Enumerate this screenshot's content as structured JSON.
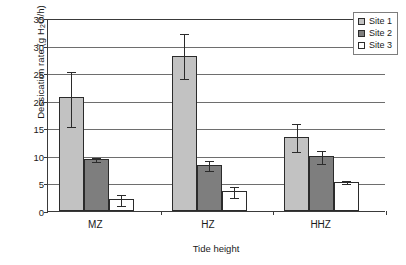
{
  "chart_data": {
    "type": "bar",
    "title": "",
    "xlabel": "Tide height",
    "ylabel": "Dessication rate (g H",
    "ylabel_sub": "2",
    "ylabel_tail": "O/h)",
    "ylabel_full": "Dessication rate (g H2O/h)",
    "categories": [
      "MZ",
      "HZ",
      "HHZ"
    ],
    "ylim": [
      0,
      35
    ],
    "yticks": [
      0,
      5,
      10,
      15,
      20,
      25,
      30,
      35
    ],
    "ytick_labels": [
      "0",
      "5",
      "10",
      "15",
      "20",
      "25",
      "30",
      "35"
    ],
    "grid": true,
    "legend_position": "top-right",
    "series": [
      {
        "name": "Site 1",
        "color": "#c2c2c2",
        "values": [
          20.7,
          28.2,
          13.4
        ],
        "err_low": [
          15.4,
          24.2,
          10.8
        ],
        "err_high": [
          25.4,
          32.2,
          15.9
        ]
      },
      {
        "name": "Site 2",
        "color": "#7e7e7e",
        "values": [
          9.5,
          8.3,
          9.9
        ],
        "err_low": [
          9.1,
          7.5,
          8.7
        ],
        "err_high": [
          9.8,
          9.2,
          11.1
        ]
      },
      {
        "name": "Site 3",
        "color": "#ffffff",
        "values": [
          2.1,
          3.7,
          5.3
        ],
        "err_low": [
          1.1,
          2.6,
          5.0
        ],
        "err_high": [
          3.0,
          4.6,
          5.7
        ]
      }
    ]
  },
  "legend": {
    "items": [
      {
        "label": "Site 1"
      },
      {
        "label": "Site 2"
      },
      {
        "label": "Site 3"
      }
    ]
  },
  "axes": {
    "x_title": "Tide height",
    "y_title_main": "Dessication rate (g H",
    "y_title_sub": "2",
    "y_title_end": "O/h)"
  },
  "colors": {
    "site1": "#c2c2c2",
    "site2": "#7e7e7e",
    "site3": "#ffffff",
    "axis": "#3a3a3a",
    "grid": "#6e6e6e",
    "outline": "#2b2b2b"
  }
}
